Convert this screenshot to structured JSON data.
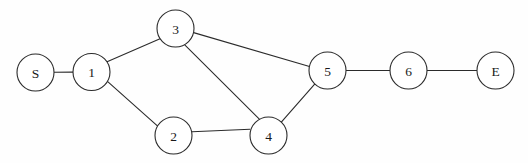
{
  "diagram": {
    "type": "node-link-graph",
    "background_color": "#fefefe",
    "stroke_color": "#2b2b2b",
    "node_fill_color": "#ffffff",
    "node_radius": 18.5,
    "width": 528,
    "height": 163
  },
  "nodes": [
    {
      "id": "S",
      "label": "S",
      "cx": 35.5,
      "cy": 72.5,
      "r": 18.5
    },
    {
      "id": "1",
      "label": "1",
      "cx": 91.5,
      "cy": 72.0,
      "r": 18.5
    },
    {
      "id": "3",
      "label": "3",
      "cx": 175.5,
      "cy": 28.5,
      "r": 18.5
    },
    {
      "id": "2",
      "label": "2",
      "cx": 173.5,
      "cy": 135.5,
      "r": 18.5
    },
    {
      "id": "4",
      "label": "4",
      "cx": 268.5,
      "cy": 135.5,
      "r": 18.5
    },
    {
      "id": "5",
      "label": "5",
      "cx": 327.5,
      "cy": 70.5,
      "r": 18.5
    },
    {
      "id": "6",
      "label": "6",
      "cx": 408.5,
      "cy": 70.5,
      "r": 18.5
    },
    {
      "id": "E",
      "label": "E",
      "cx": 495.5,
      "cy": 70.5,
      "r": 18.5
    }
  ],
  "edges": [
    {
      "id": "S-1",
      "from": "S",
      "to": "1",
      "x1": 54.0,
      "y1": 72.3,
      "x2": 73.0,
      "y2": 72.1
    },
    {
      "id": "1-3",
      "from": "1",
      "to": "3",
      "x1": 106.5,
      "y1": 62.1,
      "x2": 160.6,
      "y2": 38.5
    },
    {
      "id": "1-2",
      "from": "1",
      "to": "2",
      "x1": 107.7,
      "y1": 81.7,
      "x2": 157.4,
      "y2": 125.9
    },
    {
      "id": "3-5",
      "from": "3",
      "to": "5",
      "x1": 193.6,
      "y1": 32.6,
      "x2": 309.5,
      "y2": 66.5
    },
    {
      "id": "3-4",
      "from": "3",
      "to": "4",
      "x1": 184.5,
      "y1": 44.7,
      "x2": 259.6,
      "y2": 119.3
    },
    {
      "id": "2-4",
      "from": "2",
      "to": "4",
      "x1": 192.0,
      "y1": 131.7,
      "x2": 250.0,
      "y2": 129.2
    },
    {
      "id": "4-5",
      "from": "4",
      "to": "5",
      "x1": 281.1,
      "y1": 122.4,
      "x2": 314.9,
      "y2": 83.9
    },
    {
      "id": "5-6",
      "from": "5",
      "to": "6",
      "x1": 346.0,
      "y1": 70.5,
      "x2": 390.0,
      "y2": 70.5
    },
    {
      "id": "6-E",
      "from": "6",
      "to": "E",
      "x1": 427.0,
      "y1": 70.5,
      "x2": 477.0,
      "y2": 70.5
    }
  ],
  "adjacency_summary": {
    "S": [
      "1"
    ],
    "1": [
      "S",
      "3",
      "2"
    ],
    "2": [
      "1",
      "4"
    ],
    "3": [
      "1",
      "5",
      "4"
    ],
    "4": [
      "3",
      "2",
      "5"
    ],
    "5": [
      "3",
      "4",
      "6"
    ],
    "6": [
      "5",
      "E"
    ],
    "E": [
      "6"
    ]
  }
}
